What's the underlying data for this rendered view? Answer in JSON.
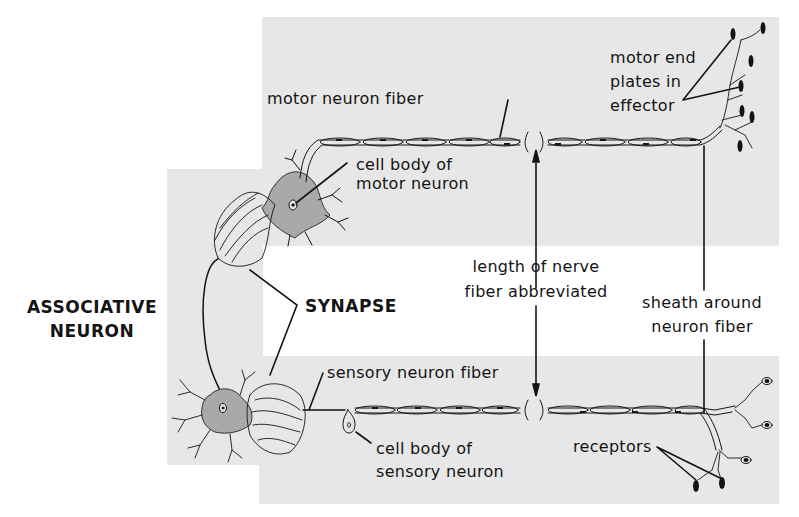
{
  "diagram": {
    "type": "reflex-arc-neuron-diagram",
    "background_color": "#ffffff",
    "panel_color": "#e7e7e7",
    "cell_body_color": "#a9a9a9",
    "line_color": "#141414"
  },
  "labels": {
    "associative_neuron": [
      "ASSOCIATIVE",
      "NEURON"
    ],
    "synapse": "SYNAPSE",
    "motor_neuron_fiber": "motor neuron fiber",
    "cell_body_motor": [
      "cell body of",
      "motor neuron"
    ],
    "length_abbreviated": [
      "length of nerve",
      "fiber abbreviated"
    ],
    "motor_end_plates": [
      "motor end",
      "plates in",
      "effector"
    ],
    "sheath": [
      "sheath around",
      "neuron fiber"
    ],
    "sensory_neuron_fiber": "sensory neuron fiber",
    "cell_body_sensory": [
      "cell body of",
      "sensory neuron"
    ],
    "receptors": "receptors"
  }
}
